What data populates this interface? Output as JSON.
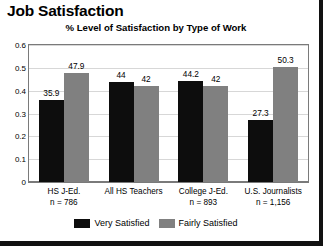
{
  "chart_data": {
    "type": "bar",
    "title": "Job Satisfaction",
    "subtitle": "% Level of Satisfaction by Type of Work",
    "xlabel": "",
    "ylabel": "",
    "ylim": [
      0,
      0.6
    ],
    "grid": true,
    "legend_position": "bottom",
    "yticks": [
      "0.6",
      "0.5",
      "0.4",
      "0.3",
      "0.2",
      "0.1",
      "0"
    ],
    "ytick_values": [
      0.6,
      0.5,
      0.4,
      0.3,
      0.2,
      0.1,
      0
    ],
    "categories": [
      "HS J-Ed.",
      "All HS Teachers",
      "College J-Ed.",
      "U.S. Journalists"
    ],
    "category_notes": [
      "n = 786",
      "",
      "n = 893",
      "n = 1,156"
    ],
    "series": [
      {
        "name": "Very Satisfied",
        "color": "#0d0d0d",
        "values": [
          35.9,
          44,
          44.2,
          27.3
        ],
        "labels": [
          "35.9",
          "44",
          "44.2",
          "27.3"
        ]
      },
      {
        "name": "Fairly Satisfied",
        "color": "#808080",
        "values": [
          47.9,
          42,
          42,
          50.3
        ],
        "labels": [
          "47.9",
          "42",
          "42",
          "50.3"
        ]
      }
    ]
  },
  "legend": {
    "entries": [
      {
        "label": "Very Satisfied",
        "color": "#0d0d0d"
      },
      {
        "label": "Fairly Satisfied",
        "color": "#808080"
      }
    ]
  }
}
